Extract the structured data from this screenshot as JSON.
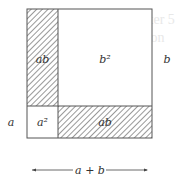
{
  "diagram": {
    "regions": [
      {
        "id": "ab_vertical",
        "label": "ab",
        "hatched": true
      },
      {
        "id": "b_squared",
        "label": "b²",
        "hatched": false
      },
      {
        "id": "a_squared",
        "label": "a²",
        "hatched": false
      },
      {
        "id": "ab_horizontal",
        "label": "ab",
        "hatched": true
      }
    ],
    "side_labels": {
      "left": "a",
      "right": "b"
    },
    "bottom_dimension": {
      "label": "a + b"
    },
    "colors": {
      "stroke": "#555555",
      "hatch": "#444444",
      "background": "#ffffff"
    }
  }
}
